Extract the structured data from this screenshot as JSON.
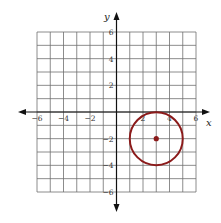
{
  "chart_data": {
    "type": "scatter",
    "title": "",
    "xlabel": "x",
    "ylabel": "y",
    "xlim": [
      -6,
      6
    ],
    "ylim": [
      -6,
      6
    ],
    "grid": true,
    "grid_step": 1,
    "x_ticks": [
      -6,
      -4,
      -2,
      2,
      4,
      6
    ],
    "y_ticks": [
      6,
      4,
      2,
      -2,
      -4,
      -6
    ],
    "x_tick_labels": [
      "−6",
      "−4",
      "−2",
      "2",
      "4",
      "6"
    ],
    "y_tick_labels": [
      "6",
      "4",
      "2",
      "−2",
      "−4",
      "−6"
    ],
    "shapes": [
      {
        "kind": "circle",
        "center": [
          3,
          -2
        ],
        "radius": 2,
        "color": "#8b1a1a"
      }
    ],
    "points": [
      {
        "x": 3,
        "y": -2,
        "color": "#8b1a1a",
        "label": "center"
      }
    ]
  },
  "axes": {
    "x_label": "x",
    "y_label": "y"
  },
  "colors": {
    "circle": "#8b1a1a",
    "grid": "#6e6e6e",
    "axis": "#111111"
  }
}
